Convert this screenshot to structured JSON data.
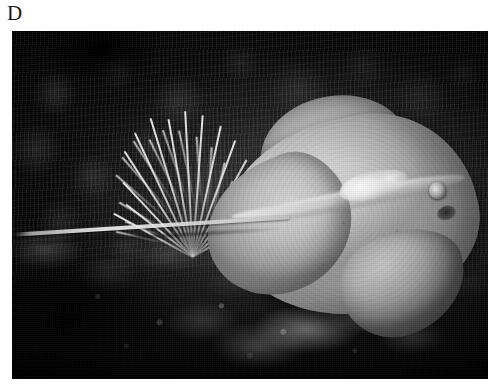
{
  "figure": {
    "panel_label": "D",
    "caption": "",
    "colors": {
      "page_background": "#ffffff",
      "label_text": "#1a1a1a",
      "photo_dark": "#0d0f0d",
      "photo_midtone": "#3a3a36",
      "subject_highlight": "#e0ded2",
      "subject_scar_white": "#fbfaf4",
      "coral_highlight": "#f5f5ee"
    },
    "photo": {
      "kind": "photograph",
      "rendering": "grayscale",
      "alt": "Underwater grayscale photograph of a stingray resting over a reef",
      "frame": {
        "x": 12,
        "y": 31,
        "width": 476,
        "height": 348
      },
      "subjects": [
        {
          "name": "stingray",
          "description": "pale grey stingray with broad rhombic pectoral disc, long whip-like tail sweeping to the left, visible eye and spiracle, bright white scar marking on the back"
        },
        {
          "name": "sea-whip-coral",
          "description": "pale branching gorgonian sea whip cluster rising behind the tail"
        },
        {
          "name": "algal-turf",
          "description": "dark dense filamentous algae covering the upper background"
        },
        {
          "name": "rubble-seafloor",
          "description": "light rocky rubble and coral rock across the lower third"
        }
      ]
    }
  }
}
